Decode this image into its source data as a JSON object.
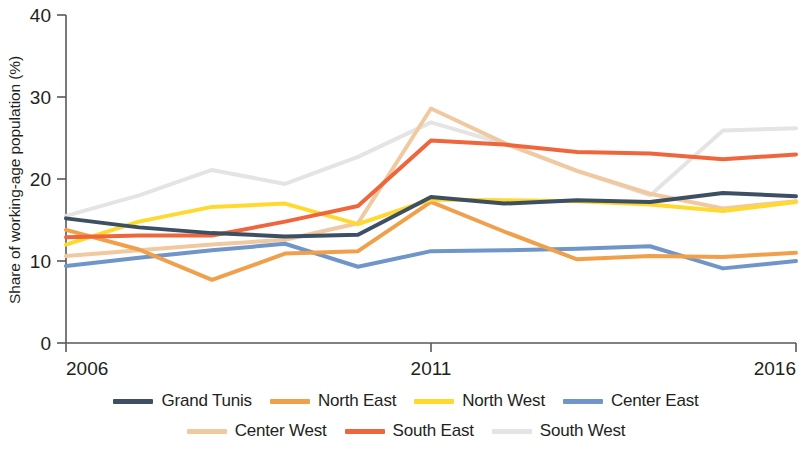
{
  "chart_data": {
    "type": "line",
    "title": "",
    "xlabel": "",
    "ylabel": "Share of working-age population (%)",
    "xlim": [
      2006,
      2016
    ],
    "ylim": [
      0,
      40
    ],
    "yticks": [
      0,
      10,
      20,
      30,
      40
    ],
    "ytick_labels": [
      "0",
      "10",
      "20",
      "30",
      "40"
    ],
    "xticks": [
      2006,
      2011,
      2016
    ],
    "xtick_labels": [
      "2006",
      "2011",
      "2016"
    ],
    "grid": false,
    "legend_position": "bottom",
    "x": [
      2006,
      2007,
      2008,
      2009,
      2010,
      2011,
      2012,
      2013,
      2014,
      2015,
      2016
    ],
    "series": [
      {
        "name": "Grand Tunis",
        "color": "#3d4f63",
        "values": [
          15.2,
          14.1,
          13.4,
          13.0,
          13.2,
          17.8,
          17.0,
          17.4,
          17.2,
          18.3,
          17.9
        ]
      },
      {
        "name": "North East",
        "color": "#f0a04b",
        "values": [
          13.8,
          11.4,
          7.7,
          10.9,
          11.2,
          17.2,
          13.6,
          10.2,
          10.6,
          10.5,
          11.0
        ]
      },
      {
        "name": "North West",
        "color": "#ffd92e",
        "values": [
          12.0,
          14.8,
          16.6,
          17.0,
          14.5,
          17.5,
          17.4,
          17.3,
          16.9,
          16.1,
          17.2
        ]
      },
      {
        "name": "Center East",
        "color": "#6f95c9",
        "values": [
          9.4,
          10.4,
          11.3,
          12.1,
          9.3,
          11.2,
          11.3,
          11.5,
          11.8,
          9.1,
          10.0
        ]
      },
      {
        "name": "Center West",
        "color": "#f0c9a0",
        "values": [
          10.6,
          11.3,
          12.0,
          12.6,
          14.6,
          28.6,
          24.4,
          21.0,
          18.2,
          16.4,
          17.3
        ]
      },
      {
        "name": "South East",
        "color": "#f0663c",
        "values": [
          12.9,
          13.1,
          13.1,
          14.8,
          16.7,
          24.7,
          24.2,
          23.3,
          23.1,
          22.4,
          23.0
        ]
      },
      {
        "name": "South West",
        "color": "#e4e4e4",
        "values": [
          15.5,
          18.0,
          21.1,
          19.4,
          22.7,
          26.9,
          24.3,
          21.0,
          18.0,
          25.9,
          26.2
        ]
      }
    ]
  },
  "legend": {
    "rows": [
      [
        {
          "label": "Grand Tunis",
          "color": "#3d4f63"
        },
        {
          "label": "North East",
          "color": "#f0a04b"
        },
        {
          "label": "North West",
          "color": "#ffd92e"
        },
        {
          "label": "Center East",
          "color": "#6f95c9"
        }
      ],
      [
        {
          "label": "Center West",
          "color": "#f0c9a0"
        },
        {
          "label": "South East",
          "color": "#f0663c"
        },
        {
          "label": "South West",
          "color": "#e4e4e4"
        }
      ]
    ]
  }
}
